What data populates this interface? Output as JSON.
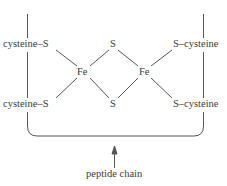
{
  "diagram": {
    "type": "chemical-structure",
    "labels": {
      "top_left": "cysteine–S",
      "bottom_left": "cysteine–S",
      "top_right": "S–cysteine",
      "bottom_right": "S–cysteine",
      "bridge_top": "S",
      "bridge_bottom": "S",
      "iron_left": "Fe",
      "iron_right": "Fe",
      "peptide": "peptide chain"
    },
    "colors": {
      "line": "#555555",
      "text": "#3a3a3a",
      "background": "#ffffff"
    }
  }
}
